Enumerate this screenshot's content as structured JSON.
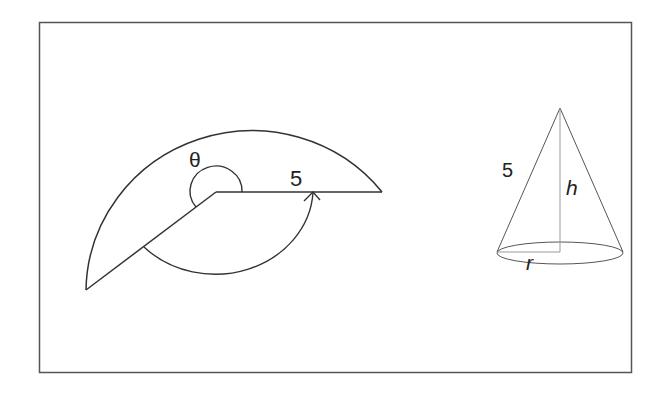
{
  "figure": {
    "colors": {
      "background": "#ffffff",
      "frame": "#555555",
      "sector_stroke": "#333333",
      "cone_stroke": "#555555",
      "cone_guides": "#999999",
      "text": "#222222"
    },
    "sector": {
      "angle_label": "θ",
      "radius_label": "5"
    },
    "cone": {
      "slant_label": "5",
      "height_label": "h",
      "radius_label": "r"
    }
  }
}
